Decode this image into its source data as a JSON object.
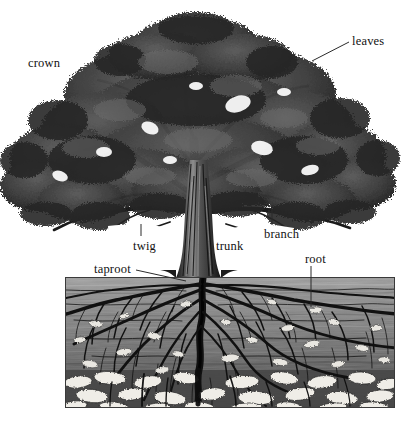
{
  "figure": {
    "background_color": "#ffffff",
    "line_color": "#2b2b2b",
    "text_color": "#111111"
  },
  "labels": {
    "crown": {
      "text": "crown",
      "x": 28,
      "y": 57
    },
    "leaves": {
      "text": "leaves",
      "x": 352,
      "y": 35
    },
    "twig": {
      "text": "twig",
      "x": 133,
      "y": 240
    },
    "trunk": {
      "text": "trunk",
      "x": 216,
      "y": 240
    },
    "branch": {
      "text": "branch",
      "x": 264,
      "y": 228
    },
    "taproot": {
      "text": "taproot",
      "x": 94,
      "y": 263
    },
    "root": {
      "text": "root",
      "x": 305,
      "y": 253
    }
  },
  "soil": {
    "x": 65,
    "y": 277,
    "width": 330,
    "height": 131,
    "layer_colors": [
      "#9a9a9a",
      "#8b8b8b",
      "#7c7c7c",
      "#6d6d6d",
      "#5e5e5e",
      "#4f4f4f"
    ],
    "stone_color": "#e8e6e0",
    "root_color": "#141414"
  },
  "tree": {
    "canopy_color": "#2f2f2f",
    "canopy_highlight": "#777777",
    "trunk_color": "#4a4a4a",
    "trunk_shadow": "#1e1e1e",
    "canopy_top_y": 10,
    "canopy_left_x": 10,
    "canopy_right_x": 392,
    "trunk_base_y": 277
  }
}
